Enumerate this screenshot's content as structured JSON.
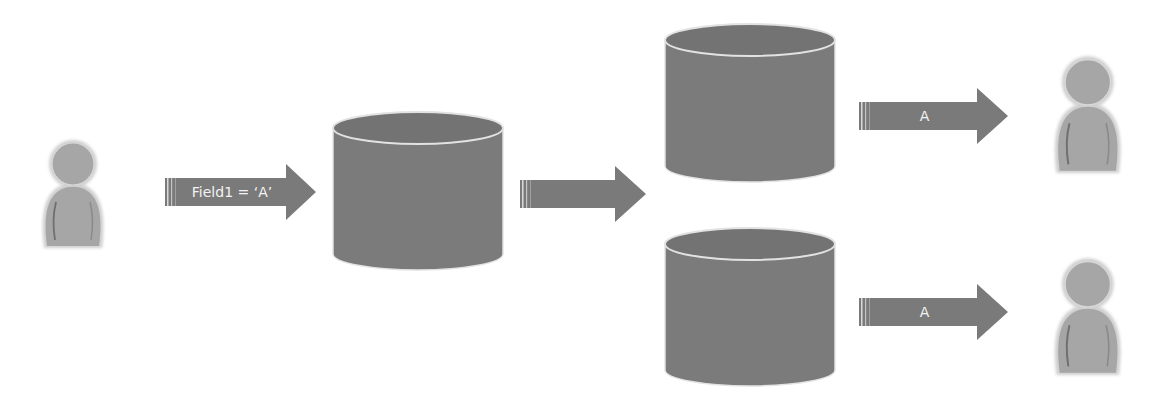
{
  "diagram": {
    "colors": {
      "shape_fill": "#7a7a7a",
      "shape_top": "#6e6e6e",
      "rim": "#dcdcdc",
      "user_fill": "#a9a9a9",
      "label_text": "#f2f2f2",
      "background": "#ffffff"
    },
    "nodes": [
      {
        "id": "user-source",
        "type": "user-icon"
      },
      {
        "id": "db-central",
        "type": "database-icon"
      },
      {
        "id": "db-replica-1",
        "type": "database-icon"
      },
      {
        "id": "db-replica-2",
        "type": "database-icon"
      },
      {
        "id": "user-target-1",
        "type": "user-icon"
      },
      {
        "id": "user-target-2",
        "type": "user-icon"
      }
    ],
    "arrows": [
      {
        "id": "arrow-write",
        "from": "user-source",
        "to": "db-central",
        "label": "Field1 = ‘A’"
      },
      {
        "id": "arrow-replicate",
        "from": "db-central",
        "to": "db-replicas",
        "label": ""
      },
      {
        "id": "arrow-read-1",
        "from": "db-replica-1",
        "to": "user-target-1",
        "label": "A"
      },
      {
        "id": "arrow-read-2",
        "from": "db-replica-2",
        "to": "user-target-2",
        "label": "A"
      }
    ]
  }
}
